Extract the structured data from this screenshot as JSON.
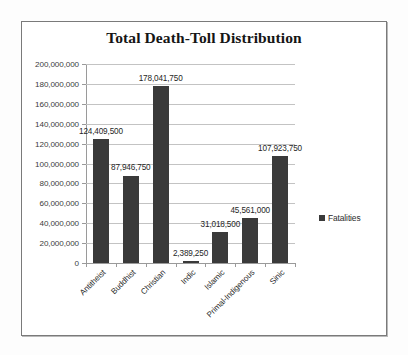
{
  "chart_data": {
    "type": "bar",
    "title": "Total Death-Toll Distribution",
    "xlabel": "",
    "ylabel": "",
    "ylim": [
      0,
      200000000
    ],
    "grid": true,
    "legend_position": "right",
    "categories": [
      "Antitheist",
      "Buddhist",
      "Christian",
      "Indic",
      "Islamic",
      "Primal-Indigenous",
      "Sinic"
    ],
    "series": [
      {
        "name": "Fatalities",
        "color": "#3a3a3a",
        "values": [
          124409500,
          87946750,
          178041750,
          2389250,
          31018500,
          45561000,
          107923750
        ]
      }
    ],
    "data_labels": [
      "124,409,500",
      "87,946,750",
      "178,041,750",
      "2,389,250",
      "31,018,500",
      "45,561,000",
      "107,923,750"
    ],
    "ytick_values": [
      200000000,
      180000000,
      160000000,
      140000000,
      120000000,
      100000000,
      80000000,
      60000000,
      40000000,
      20000000,
      0
    ],
    "ytick_labels": [
      "200,000,000",
      "180,000,000",
      "160,000,000",
      "140,000,000",
      "120,000,000",
      "100,000,000",
      "80,000,000",
      "60,000,000",
      "40,000,000",
      "20,000,000",
      "0"
    ]
  },
  "legend": {
    "entries": [
      {
        "label": "Fatalities",
        "color": "#3a3a3a"
      }
    ]
  },
  "colors": {
    "bar": "#3a3a3a",
    "gridline": "#c3c3c3",
    "axis": "#9a9a9a",
    "frame": "#7a7a7a",
    "text": "#2b2b2b",
    "background": "#ffffff"
  }
}
